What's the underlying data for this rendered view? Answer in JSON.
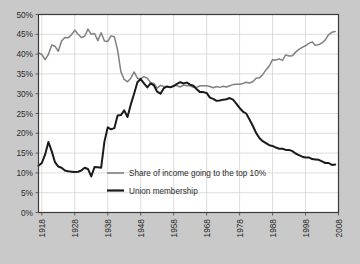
{
  "chart_data": {
    "type": "line",
    "title": "",
    "subtitle": "",
    "xlabel": "",
    "ylabel": "",
    "xlim": [
      1917,
      2008
    ],
    "ylim": [
      0,
      50
    ],
    "grid": true,
    "legend_position": "inside-center-lower",
    "xticks": [
      "1918",
      "1928",
      "1938",
      "1948",
      "1958",
      "1968",
      "1978",
      "1988",
      "1998",
      "2008"
    ],
    "xtick_values": [
      1918,
      1928,
      1938,
      1948,
      1958,
      1968,
      1978,
      1988,
      1998,
      2008
    ],
    "yticks": [
      "0%",
      "5%",
      "10%",
      "15%",
      "20%",
      "25%",
      "30%",
      "35%",
      "40%",
      "45%",
      "50%"
    ],
    "ytick_values": [
      0,
      5,
      10,
      15,
      20,
      25,
      30,
      35,
      40,
      45,
      50
    ],
    "series": [
      {
        "name": "Share of income going to the top 10%",
        "color": "#808080",
        "width": 1.5,
        "x": [
          1917,
          1918,
          1919,
          1920,
          1921,
          1922,
          1923,
          1924,
          1925,
          1926,
          1927,
          1928,
          1929,
          1930,
          1931,
          1932,
          1933,
          1934,
          1935,
          1936,
          1937,
          1938,
          1939,
          1940,
          1941,
          1942,
          1943,
          1944,
          1945,
          1946,
          1947,
          1948,
          1949,
          1950,
          1951,
          1952,
          1953,
          1954,
          1955,
          1956,
          1957,
          1958,
          1959,
          1960,
          1961,
          1962,
          1963,
          1964,
          1965,
          1966,
          1967,
          1968,
          1969,
          1970,
          1971,
          1972,
          1973,
          1974,
          1975,
          1976,
          1977,
          1978,
          1979,
          1980,
          1981,
          1982,
          1983,
          1984,
          1985,
          1986,
          1987,
          1988,
          1989,
          1990,
          1991,
          1992,
          1993,
          1994,
          1995,
          1996,
          1997,
          1998,
          1999,
          2000,
          2001,
          2002,
          2003,
          2004,
          2005,
          2006,
          2007
        ],
        "y": [
          40.3,
          39.9,
          38.6,
          39.9,
          42.3,
          42.0,
          40.7,
          43.3,
          44.2,
          44.1,
          44.9,
          46.0,
          45.0,
          44.2,
          44.5,
          46.3,
          45.0,
          45.2,
          43.4,
          45.4,
          43.3,
          43.2,
          44.6,
          44.4,
          41.0,
          35.5,
          33.6,
          33.0,
          33.9,
          35.5,
          33.9,
          33.8,
          34.3,
          33.9,
          32.8,
          32.6,
          31.4,
          32.1,
          31.8,
          31.8,
          31.7,
          32.1,
          32.0,
          31.7,
          32.2,
          32.0,
          32.0,
          31.6,
          31.6,
          32.0,
          32.0,
          32.0,
          31.8,
          31.5,
          31.8,
          31.6,
          31.9,
          31.7,
          32.0,
          32.3,
          32.4,
          32.4,
          32.6,
          32.9,
          32.7,
          33.0,
          33.9,
          34.0,
          34.8,
          36.0,
          37.0,
          38.6,
          38.5,
          38.8,
          38.4,
          39.8,
          39.5,
          39.6,
          40.5,
          41.2,
          41.7,
          42.1,
          42.7,
          43.1,
          42.2,
          42.4,
          42.8,
          43.6,
          44.9,
          45.5,
          45.7
        ]
      },
      {
        "name": "Union membership",
        "color": "#1a1a1a",
        "width": 2.0,
        "x": [
          1917,
          1918,
          1919,
          1920,
          1921,
          1922,
          1923,
          1924,
          1925,
          1926,
          1927,
          1928,
          1929,
          1930,
          1931,
          1932,
          1933,
          1934,
          1935,
          1936,
          1937,
          1938,
          1939,
          1940,
          1941,
          1942,
          1943,
          1944,
          1945,
          1946,
          1947,
          1948,
          1949,
          1950,
          1951,
          1952,
          1953,
          1954,
          1955,
          1956,
          1957,
          1958,
          1959,
          1960,
          1961,
          1962,
          1963,
          1964,
          1965,
          1966,
          1967,
          1968,
          1969,
          1970,
          1971,
          1972,
          1973,
          1974,
          1975,
          1976,
          1977,
          1978,
          1979,
          1980,
          1981,
          1982,
          1983,
          1984,
          1985,
          1986,
          1987,
          1988,
          1989,
          1990,
          1991,
          1992,
          1993,
          1994,
          1995,
          1996,
          1997,
          1998,
          1999,
          2000,
          2001,
          2002,
          2003,
          2004,
          2005,
          2006,
          2007
        ],
        "y": [
          11.8,
          12.5,
          14.6,
          17.8,
          15.5,
          12.7,
          11.6,
          11.3,
          10.6,
          10.4,
          10.3,
          10.2,
          10.3,
          10.6,
          11.3,
          11.0,
          9.1,
          11.5,
          11.4,
          11.3,
          17.9,
          21.5,
          21.0,
          21.3,
          24.5,
          24.6,
          25.8,
          24.1,
          27.3,
          30.0,
          32.9,
          33.7,
          32.6,
          31.6,
          32.6,
          32.1,
          30.5,
          30.0,
          31.4,
          31.8,
          31.6,
          31.9,
          32.5,
          32.9,
          32.6,
          32.8,
          32.3,
          32.0,
          31.1,
          30.4,
          30.4,
          30.2,
          29.0,
          28.7,
          28.2,
          28.3,
          28.5,
          28.6,
          28.9,
          28.5,
          27.5,
          26.4,
          25.5,
          25.0,
          23.5,
          21.9,
          20.1,
          18.8,
          18.0,
          17.5,
          17.0,
          16.8,
          16.4,
          16.1,
          16.1,
          15.8,
          15.8,
          15.5,
          14.9,
          14.5,
          14.1,
          13.9,
          13.9,
          13.5,
          13.4,
          13.3,
          12.9,
          12.5,
          12.5,
          12.0,
          12.1
        ]
      }
    ]
  },
  "legend": {
    "entries": [
      {
        "label": "Share of income going to the top 10%",
        "color": "#808080"
      },
      {
        "label": "Union membership",
        "color": "#1a1a1a"
      }
    ]
  },
  "style": {
    "page_background": "#c9c9c9",
    "plot_background": "#ffffff",
    "plot_border": "#3a3a3a",
    "gridline_color": "#d4d4d4",
    "tick_color": "#555555",
    "text_color": "#2b2b2b"
  }
}
